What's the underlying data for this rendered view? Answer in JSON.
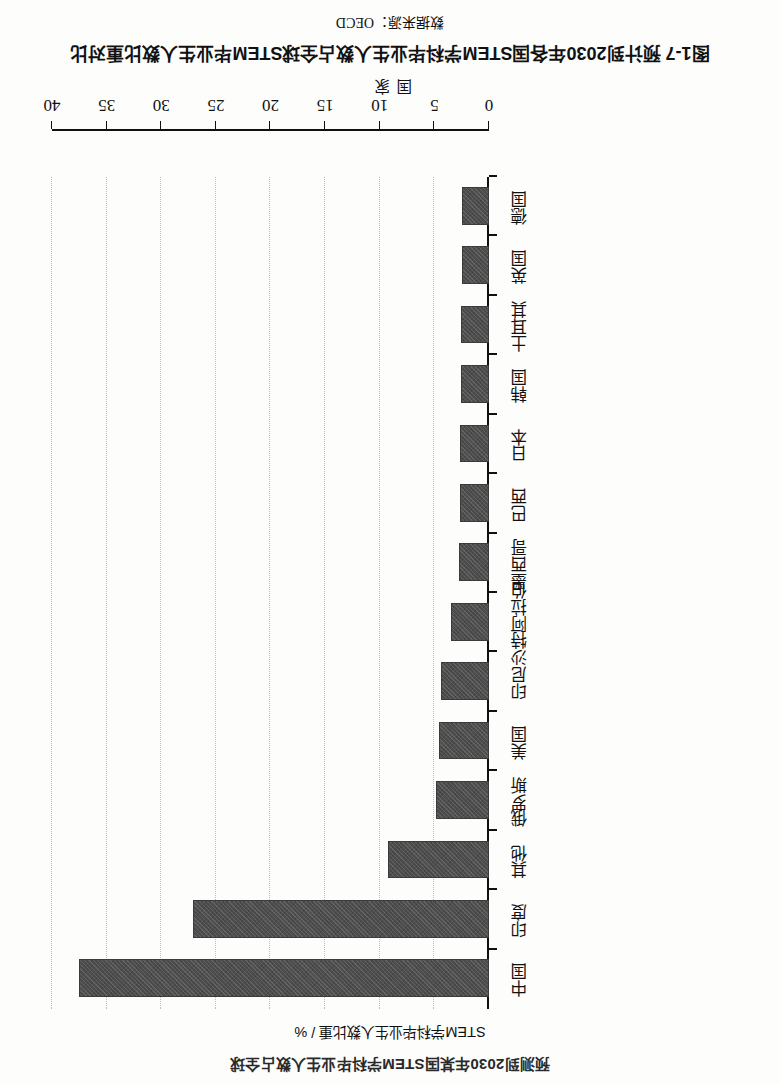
{
  "figure": {
    "caption_number": "图1-7",
    "caption_text": "预计到2030年各国STEM学科毕业生人数占全球STEM毕业生人数比重对比",
    "caption_full": "图1-7  预计到2030年各国STEM学科毕业生人数占全球STEM毕业生人数比重对比",
    "source_label": "数据来源：OECD",
    "partial_running_text": "预测到2030年某国STEM学科毕业生人数占全球"
  },
  "chart_data": {
    "type": "bar",
    "orientation": "vertical",
    "title": "预计到2030年各国STEM学科毕业生人数占全球STEM毕业生人数比重对比",
    "xlabel": "国家",
    "ylabel": "STEM学科毕业生人数比重 / %",
    "ylim": [
      0,
      40
    ],
    "yticks": [
      0,
      5,
      10,
      15,
      20,
      25,
      30,
      35,
      40
    ],
    "ytick_labels": [
      "0",
      "5",
      "10",
      "15",
      "20",
      "25",
      "30",
      "35",
      "40"
    ],
    "grid": "horizontal-dotted",
    "legend": "none",
    "bar_color": "#4d4d4d",
    "categories": [
      "中国",
      "印度",
      "其他",
      "俄罗斯",
      "美国",
      "印尼",
      "沙特阿拉伯",
      "墨西哥",
      "巴西",
      "日本",
      "韩国",
      "土耳其",
      "英国",
      "德国"
    ],
    "values": [
      37.3,
      26.9,
      9.1,
      4.7,
      4.4,
      4.2,
      3.3,
      2.6,
      2.5,
      2.5,
      2.4,
      2.4,
      2.3,
      2.3
    ]
  }
}
